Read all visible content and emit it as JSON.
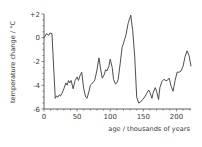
{
  "chart_data": {
    "type": "line",
    "title": "",
    "xlabel": "age / thousands of years",
    "ylabel": "temperature change / °C",
    "xlim": [
      0,
      222
    ],
    "ylim": [
      -6,
      2
    ],
    "x_ticks": [
      0,
      50,
      100,
      150,
      200
    ],
    "x_tick_labels": [
      "0",
      "50",
      "100",
      "150",
      "200"
    ],
    "y_ticks": [
      2,
      0,
      -2,
      -4,
      -6
    ],
    "y_tick_labels": [
      "+2",
      "0",
      "-2",
      "-4",
      "-6"
    ],
    "grid": false,
    "legend": null,
    "series": [
      {
        "name": "temperature change",
        "color": "#3a3a3a",
        "x": [
          0,
          4,
          7,
          9,
          12,
          17,
          19,
          21,
          23,
          25,
          27,
          30,
          33,
          35,
          37,
          39,
          41,
          44,
          47,
          50,
          52,
          55,
          57,
          60,
          63,
          65,
          68,
          70,
          72,
          75,
          77,
          80,
          83,
          86,
          88,
          91,
          93,
          95,
          98,
          100,
          103,
          105,
          108,
          110,
          112,
          115,
          118,
          121,
          124,
          127,
          131,
          134,
          137,
          140,
          143,
          146,
          149,
          152,
          155,
          158,
          160,
          163,
          165,
          168,
          170,
          173,
          175,
          178,
          181,
          184,
          186,
          189,
          192,
          195,
          198,
          201,
          204,
          207,
          210,
          213,
          216,
          219,
          222
        ],
        "values": [
          0.0,
          0.35,
          0.2,
          0.4,
          0.35,
          -5.1,
          -4.9,
          -5.0,
          -4.8,
          -4.9,
          -4.7,
          -4.3,
          -3.8,
          -4.0,
          -3.6,
          -3.8,
          -3.6,
          -4.3,
          -3.6,
          -3.3,
          -3.6,
          -3.1,
          -2.9,
          -4.3,
          -5.0,
          -5.1,
          -4.5,
          -4.0,
          -3.9,
          -3.7,
          -3.5,
          -2.7,
          -1.7,
          -2.8,
          -3.4,
          -3.1,
          -2.7,
          -2.8,
          -2.4,
          -1.8,
          -2.5,
          -3.5,
          -3.9,
          -3.8,
          -3.5,
          -2.2,
          -0.8,
          -0.3,
          0.3,
          1.2,
          1.9,
          0.6,
          -1.6,
          -5.0,
          -5.5,
          -5.4,
          -5.2,
          -5.0,
          -4.7,
          -4.4,
          -4.6,
          -5.1,
          -4.6,
          -4.2,
          -4.5,
          -5.2,
          -4.2,
          -3.7,
          -3.5,
          -3.6,
          -3.6,
          -3.4,
          -4.1,
          -4.5,
          -3.6,
          -2.9,
          -2.9,
          -2.8,
          -2.4,
          -1.6,
          -1.1,
          -1.5,
          -2.4
        ]
      }
    ]
  }
}
